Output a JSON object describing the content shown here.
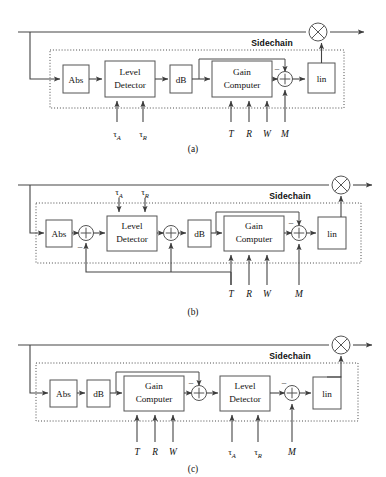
{
  "figure": {
    "background": "#ffffff",
    "line_color": "#444444",
    "box_color": "#ffffff",
    "box_border": "#555555"
  },
  "blocks": {
    "abs": "Abs",
    "level_detector_l1": "Level",
    "level_detector_l2": "Detector",
    "db": "dB",
    "gain_computer_l1": "Gain",
    "gain_computer_l2": "Computer",
    "lin": "lin"
  },
  "labels": {
    "sidechain": "Sidechain",
    "tau_attack": "τ",
    "tau_attack_sub": "A",
    "tau_release": "τ",
    "tau_release_sub": "R",
    "threshold": "T",
    "ratio": "R",
    "knee_width": "W",
    "makeup_gain": "M",
    "minus": "–"
  },
  "captions": {
    "a": "(a)",
    "b": "(b)",
    "c": "(c)"
  },
  "icons": {
    "multiplier": "⊗",
    "summer": "+"
  },
  "panels": [
    {
      "id": "a",
      "caption": "(a)",
      "chain": [
        "Abs",
        "Level Detector",
        "dB",
        "Gain Computer",
        "summer",
        "lin"
      ],
      "control_inputs": [
        "τA",
        "τR",
        "T",
        "R",
        "W",
        "M"
      ],
      "output_node": "multiplier"
    },
    {
      "id": "b",
      "caption": "(b)",
      "chain": [
        "Abs",
        "summer",
        "Level Detector",
        "summer",
        "dB",
        "Gain Computer",
        "summer",
        "lin"
      ],
      "control_inputs": [
        "τA",
        "τR",
        "T",
        "R",
        "W",
        "M"
      ],
      "output_node": "multiplier",
      "feedback": true
    },
    {
      "id": "c",
      "caption": "(c)",
      "chain": [
        "Abs",
        "dB",
        "Gain Computer",
        "summer",
        "Level Detector",
        "summer",
        "lin"
      ],
      "control_inputs": [
        "T",
        "R",
        "W",
        "τA",
        "τR",
        "M"
      ],
      "output_node": "multiplier"
    }
  ]
}
